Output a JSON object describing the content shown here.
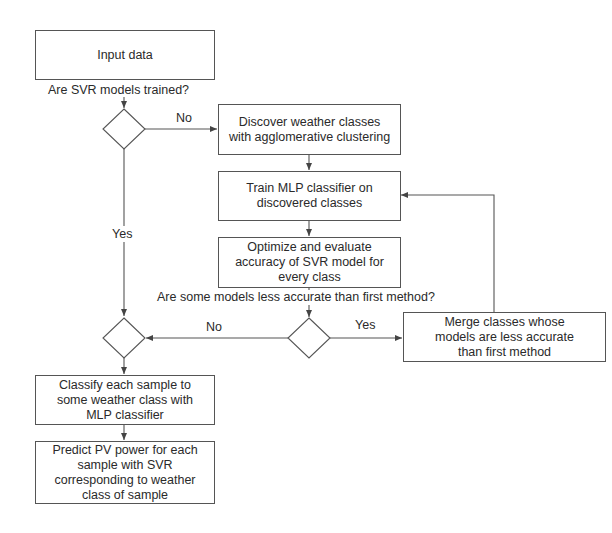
{
  "diagram": {
    "type": "flowchart",
    "nodes": {
      "input": {
        "label": "Input data"
      },
      "discover": {
        "label": "Discover weather classes\nwith agglomerative clustering"
      },
      "train": {
        "label": "Train MLP classifier on\ndiscovered classes"
      },
      "optimize": {
        "label": "Optimize and evaluate\naccuracy of SVR model for\nevery class"
      },
      "merge": {
        "label": "Merge classes whose\nmodels are less accurate\nthan first method"
      },
      "classify": {
        "label": "Classify each sample to\nsome weather class with\nMLP classifier"
      },
      "predict": {
        "label": "Predict PV power for each\nsample with SVR\ncorresponding to weather\nclass of sample"
      }
    },
    "decisions": {
      "q1": {
        "question": "Are SVR models trained?",
        "yes": "Yes",
        "no": "No"
      },
      "q2": {
        "question": "Are some models less accurate than first method?",
        "yes": "Yes",
        "no": "No"
      },
      "join": {
        "question": ""
      }
    },
    "edges": [
      {
        "from": "input",
        "to": "q1"
      },
      {
        "from": "q1",
        "to": "discover",
        "label": "No"
      },
      {
        "from": "q1",
        "to": "join",
        "label": "Yes"
      },
      {
        "from": "discover",
        "to": "train"
      },
      {
        "from": "train",
        "to": "optimize"
      },
      {
        "from": "optimize",
        "to": "q2"
      },
      {
        "from": "q2",
        "to": "merge",
        "label": "Yes"
      },
      {
        "from": "q2",
        "to": "join",
        "label": "No"
      },
      {
        "from": "merge",
        "to": "train"
      },
      {
        "from": "join",
        "to": "classify"
      },
      {
        "from": "classify",
        "to": "predict"
      }
    ]
  },
  "colors": {
    "stroke": "#555555",
    "text": "#2a2a2a",
    "background": "#ffffff"
  }
}
